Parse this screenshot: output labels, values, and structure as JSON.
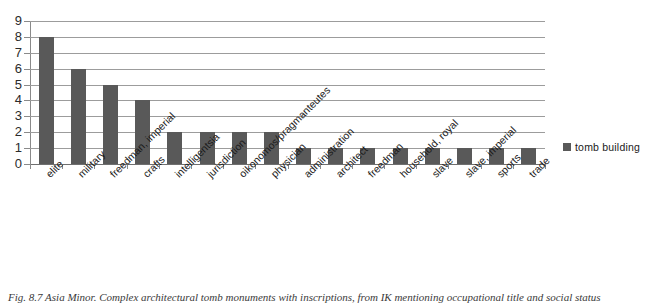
{
  "chart_data": {
    "type": "bar",
    "title": "",
    "subtitle": "",
    "xlabel": "",
    "ylabel": "",
    "ylim": [
      0,
      9
    ],
    "ytick_labels": [
      "9",
      "8",
      "7",
      "6",
      "5",
      "4",
      "3",
      "2",
      "1",
      "0"
    ],
    "yticks": [
      9,
      8,
      7,
      6,
      5,
      4,
      3,
      2,
      1,
      0
    ],
    "grid": true,
    "legend_position": "right",
    "categories": [
      "elite",
      "military",
      "freedman, imperial",
      "crafts",
      "intelligentsia",
      "jurisdiction",
      "oikonomos/pragmanteutes",
      "physician",
      "administration",
      "architect",
      "freedman",
      "household, royal",
      "slave",
      "slave, imperial",
      "sports",
      "trade"
    ],
    "series": [
      {
        "name": "tomb building",
        "color": "#595959",
        "values": [
          8,
          6,
          5,
          4,
          2,
          2,
          2,
          2,
          1,
          1,
          1,
          1,
          1,
          1,
          1,
          1
        ]
      }
    ]
  },
  "legend": {
    "label": "tomb building"
  },
  "caption": {
    "text": "Fig. 8.7 Asia Minor. Complex architectural tomb monuments with inscriptions, from IK mentioning occupational title and social status"
  },
  "colors": {
    "bar": "#595959",
    "gridline": "#9c9c9c",
    "axis": "#8a8a8a",
    "text": "#1a1a1a"
  }
}
